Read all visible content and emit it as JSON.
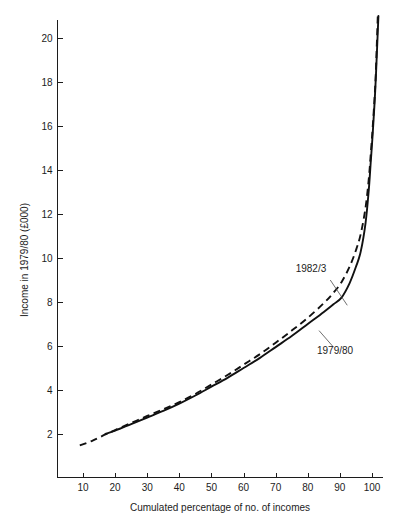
{
  "chart_data": {
    "type": "line",
    "title": "",
    "xlabel": "Cumulated percentage of no. of incomes",
    "ylabel": "Income in 1979/80 (£000)",
    "xlim": [
      0,
      108
    ],
    "ylim": [
      0,
      21
    ],
    "xticks": [
      10,
      20,
      30,
      40,
      50,
      60,
      70,
      80,
      90,
      100
    ],
    "yticks": [
      2,
      4,
      6,
      8,
      10,
      12,
      14,
      16,
      18,
      20
    ],
    "xtick_labels": [
      "10",
      "20",
      "30",
      "40",
      "50",
      "60",
      "70",
      "80",
      "90",
      "100"
    ],
    "ytick_labels": [
      "2",
      "4",
      "6",
      "8",
      "10",
      "12",
      "14",
      "16",
      "18",
      "20"
    ],
    "grid": false,
    "legend_position": "inline-annotations",
    "series": [
      {
        "name": "1979/80",
        "style": "solid",
        "points": [
          [
            17.0,
            2.0
          ],
          [
            20.0,
            2.15
          ],
          [
            25.0,
            2.45
          ],
          [
            30.0,
            2.75
          ],
          [
            35.0,
            3.05
          ],
          [
            40.0,
            3.38
          ],
          [
            45.0,
            3.75
          ],
          [
            50.0,
            4.15
          ],
          [
            55.0,
            4.55
          ],
          [
            60.0,
            5.0
          ],
          [
            65.0,
            5.45
          ],
          [
            70.0,
            5.95
          ],
          [
            75.0,
            6.45
          ],
          [
            80.0,
            7.0
          ],
          [
            85.0,
            7.55
          ],
          [
            88.0,
            7.9
          ],
          [
            90.5,
            8.2
          ],
          [
            93.0,
            8.85
          ],
          [
            95.0,
            9.6
          ],
          [
            96.5,
            10.3
          ],
          [
            98.0,
            11.6
          ],
          [
            99.0,
            13.1
          ],
          [
            99.6,
            14.35
          ],
          [
            100.2,
            15.6
          ],
          [
            101.0,
            17.6
          ],
          [
            101.6,
            19.6
          ],
          [
            102.0,
            21.0
          ]
        ]
      },
      {
        "name": "1982/3",
        "style": "dashed",
        "points": [
          [
            9.0,
            1.48
          ],
          [
            13.0,
            1.7
          ],
          [
            17.0,
            1.98
          ],
          [
            20.0,
            2.18
          ],
          [
            25.0,
            2.5
          ],
          [
            30.0,
            2.82
          ],
          [
            35.0,
            3.12
          ],
          [
            40.0,
            3.45
          ],
          [
            45.0,
            3.82
          ],
          [
            50.0,
            4.25
          ],
          [
            55.0,
            4.68
          ],
          [
            60.0,
            5.15
          ],
          [
            65.0,
            5.62
          ],
          [
            70.0,
            6.15
          ],
          [
            75.0,
            6.7
          ],
          [
            80.0,
            7.28
          ],
          [
            85.0,
            7.95
          ],
          [
            88.0,
            8.42
          ],
          [
            90.5,
            8.9
          ],
          [
            93.0,
            9.6
          ],
          [
            95.0,
            10.35
          ],
          [
            96.5,
            11.1
          ],
          [
            98.0,
            12.3
          ],
          [
            99.0,
            13.6
          ],
          [
            99.6,
            14.7
          ],
          [
            100.2,
            15.9
          ],
          [
            101.0,
            17.8
          ],
          [
            101.5,
            19.7
          ],
          [
            101.8,
            21.0
          ]
        ]
      }
    ],
    "annotations": [
      {
        "text": "1982/3",
        "label_x": 81.0,
        "label_y": 9.35,
        "leader_from_x": 87.0,
        "leader_from_y": 9.0,
        "leader_to_x": 92.3,
        "leader_to_y": 7.85
      },
      {
        "text": "1979/80",
        "label_x": 88.5,
        "label_y": 5.62,
        "leader_from_x": 88.0,
        "leader_from_y": 5.95,
        "leader_to_x": 83.5,
        "leader_to_y": 6.7
      }
    ]
  }
}
